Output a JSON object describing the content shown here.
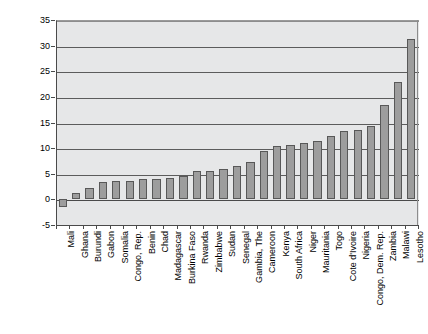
{
  "chart_data": {
    "type": "bar",
    "title": "",
    "subtitle": "",
    "xlabel": "",
    "ylabel": "",
    "ylim": [
      -5,
      35
    ],
    "y_ticks": [
      -5,
      0,
      5,
      10,
      15,
      20,
      25,
      30,
      35
    ],
    "grid": true,
    "legend": "none",
    "orientation": "vertical",
    "bar_color": "#9d9d9d",
    "bar_border_color": "#585858",
    "plot_background": "#e6e7e8",
    "categories": [
      "Mali",
      "Ghana",
      "Burundi",
      "Gabon",
      "Somalia",
      "Congo, Rep.",
      "Benin",
      "Chad",
      "Madagascar",
      "Burkina Faso",
      "Rwanda",
      "Zimbabwe",
      "Sudan",
      "Senegal",
      "Gambia, The",
      "Cameroon",
      "Kenya",
      "South Africa",
      "Niger",
      "Mauritania",
      "Togo",
      "Cote d'Ivoire",
      "Nigeria",
      "Congo, Dem. Rep.",
      "Zambia",
      "Malawi",
      "Lesotho"
    ],
    "values": [
      -1.5,
      1.2,
      2.2,
      3.3,
      3.5,
      3.5,
      3.9,
      3.9,
      4.1,
      4.6,
      5.5,
      5.6,
      6.0,
      6.6,
      7.3,
      9.4,
      10.4,
      10.6,
      11.0,
      11.3,
      12.4,
      13.4,
      13.5,
      14.4,
      18.4,
      23.0,
      31.2
    ]
  }
}
